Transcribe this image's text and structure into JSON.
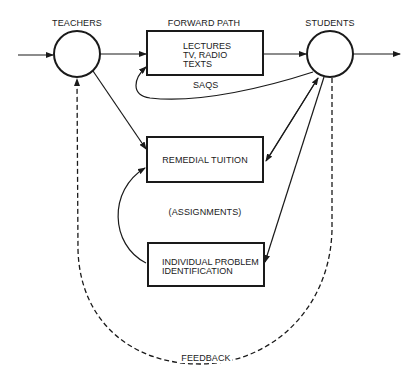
{
  "diagram": {
    "nodes": {
      "teachers": {
        "label": "TEACHERS",
        "shape": "circle"
      },
      "students": {
        "label": "STUDENTS",
        "shape": "circle"
      },
      "forward_box": {
        "title": "FORWARD PATH",
        "lines": [
          "LECTURES",
          "TV, RADIO",
          "TEXTS"
        ]
      },
      "remedial_box": {
        "label": "REMEDIAL TUITION"
      },
      "individual_box": {
        "lines": [
          "INDIVIDUAL PROBLEM",
          "IDENTIFICATION"
        ]
      }
    },
    "edge_labels": {
      "saqs": "SAQS",
      "assignments": "(ASSIGNMENTS)",
      "feedback": "FEEDBACK"
    },
    "colors": {
      "ink": "#1a1a1a",
      "background": "#ffffff"
    }
  }
}
